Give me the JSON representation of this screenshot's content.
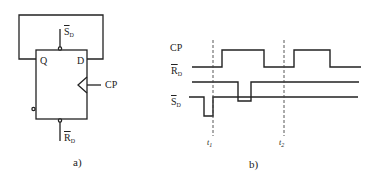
{
  "figure_a": {
    "caption": "a)",
    "pins": {
      "q": "Q",
      "d": "D",
      "cp": "CP",
      "sd_main": "S",
      "sd_sub": "D",
      "rd_main": "R",
      "rd_sub": "D"
    }
  },
  "figure_b": {
    "caption": "b)",
    "signals": [
      {
        "name": "CP",
        "overline": false
      },
      {
        "name": "R",
        "sub": "D",
        "overline": true
      },
      {
        "name": "S",
        "sub": "D",
        "overline": true
      }
    ],
    "time_markers": [
      {
        "label": "t",
        "sub": "1"
      },
      {
        "label": "t",
        "sub": "2"
      }
    ]
  },
  "colors": {
    "line": "#222222",
    "background": "#ffffff"
  }
}
